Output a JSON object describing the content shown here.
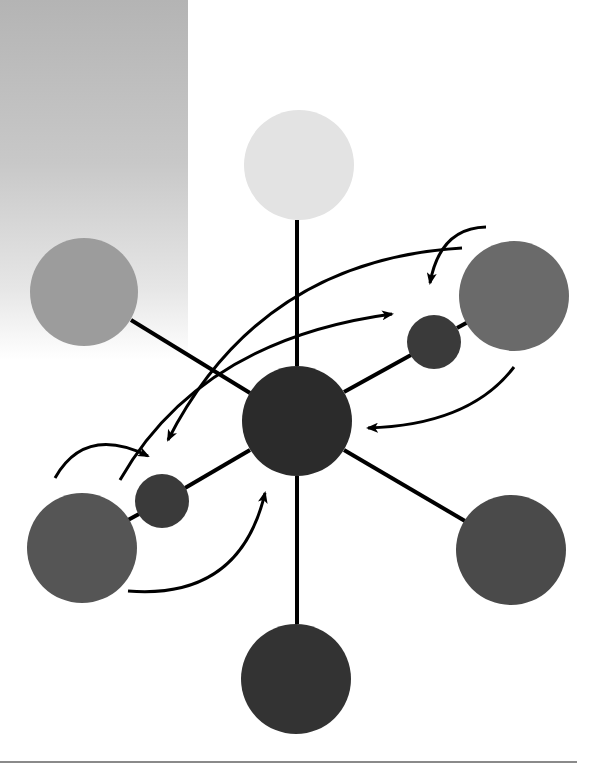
{
  "diagram": {
    "type": "hub-and-spoke molecule-like node diagram with curved arrows",
    "background_panel": {
      "color_top": "#b4b4b4",
      "color_bottom": "#ffffff"
    },
    "line_color": "#000000",
    "nodes": [
      {
        "id": "center",
        "cx": 297,
        "cy": 421,
        "r": 55,
        "fill": "#2b2b2b"
      },
      {
        "id": "top",
        "cx": 299,
        "cy": 165,
        "r": 55,
        "fill": "#e3e3e3"
      },
      {
        "id": "upper-left",
        "cx": 84,
        "cy": 292,
        "r": 54,
        "fill": "#9c9c9c"
      },
      {
        "id": "upper-right",
        "cx": 514,
        "cy": 296,
        "r": 55,
        "fill": "#6a6a6a"
      },
      {
        "id": "small-right",
        "cx": 434,
        "cy": 342,
        "r": 27,
        "fill": "#3a3a3a"
      },
      {
        "id": "small-left",
        "cx": 162,
        "cy": 501,
        "r": 27,
        "fill": "#3a3a3a"
      },
      {
        "id": "lower-left",
        "cx": 82,
        "cy": 548,
        "r": 55,
        "fill": "#555555"
      },
      {
        "id": "lower-right",
        "cx": 511,
        "cy": 550,
        "r": 55,
        "fill": "#4a4a4a"
      },
      {
        "id": "bottom",
        "cx": 296,
        "cy": 679,
        "r": 55,
        "fill": "#333333"
      }
    ],
    "edges": [
      {
        "from": "center",
        "to": "top"
      },
      {
        "from": "center",
        "to": "upper-left"
      },
      {
        "from": "center",
        "to": "small-right"
      },
      {
        "from": "small-right",
        "to": "upper-right"
      },
      {
        "from": "center",
        "to": "small-left"
      },
      {
        "from": "small-left",
        "to": "lower-left"
      },
      {
        "from": "center",
        "to": "lower-right"
      },
      {
        "from": "center",
        "to": "bottom"
      }
    ],
    "arrows": [
      {
        "id": "arrow-long-to-right",
        "desc": "from lower-left area up and right toward small-right node"
      },
      {
        "id": "arrow-long-to-left",
        "desc": "from top-right down and left toward small-left node"
      },
      {
        "id": "arrow-top-right-hook",
        "desc": "hook arrow above upper-right node pointing down"
      },
      {
        "id": "arrow-left-hook",
        "desc": "hook arrow above lower-left node pointing right"
      },
      {
        "id": "arrow-right-to-center",
        "desc": "from below upper-right node curving to center node"
      },
      {
        "id": "arrow-bottom-to-center",
        "desc": "from below lower-left node curving up to center node"
      }
    ]
  }
}
